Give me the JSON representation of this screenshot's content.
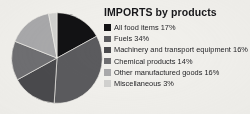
{
  "chart_data": {
    "type": "pie",
    "title": "IMPORTS by products",
    "xlabel": "",
    "ylabel": "",
    "legend_position": "right",
    "grid": false,
    "start_angle_clock": "12 o'clock",
    "direction": "clockwise",
    "unit": "%",
    "categories": [
      "All food items",
      "Fuels",
      "Machinery and transport equipment",
      "Chemical products",
      "Other manufactured goods",
      "Miscellaneous"
    ],
    "values": [
      17,
      34,
      16,
      14,
      16,
      3
    ],
    "colors": [
      "#121214",
      "#5b5b5e",
      "#4a4a4d",
      "#6f6f72",
      "#a9a9ab",
      "#d2d2d0"
    ],
    "total": 100
  },
  "legend": {
    "items": [
      {
        "label": "All food items 17%",
        "swatch": "#121214"
      },
      {
        "label": "Fuels 34%",
        "swatch": "#5b5b5e"
      },
      {
        "label": "Machinery and transport equipment 16%",
        "swatch": "#4a4a4d"
      },
      {
        "label": "Chemical products 14%",
        "swatch": "#6f6f72"
      },
      {
        "label": "Other manufactured goods 16%",
        "swatch": "#a9a9ab"
      },
      {
        "label": "Miscellaneous 3%",
        "swatch": "#d2d2d0"
      }
    ]
  },
  "page": {
    "background": "#f2f1ed"
  }
}
